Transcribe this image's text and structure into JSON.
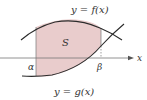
{
  "diagram": {
    "labels": {
      "upper_curve": "y = f(x)",
      "lower_curve": "y = g(x)",
      "region": "S",
      "x_axis": "x",
      "left_bound": "α",
      "right_bound": "β"
    },
    "colors": {
      "region_fill": "#e9cccc",
      "curve": "#2b2b2b",
      "axis": "#555555",
      "text": "#333333"
    }
  }
}
